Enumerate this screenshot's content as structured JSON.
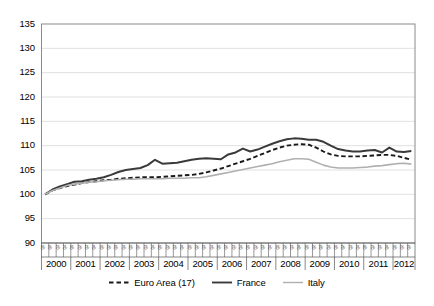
{
  "chart_data": {
    "type": "line",
    "title": "",
    "subtitle": "",
    "xlabel": "",
    "ylabel": "",
    "ylim": [
      90,
      135
    ],
    "ytick_labels": [
      "135",
      "130",
      "125",
      "120",
      "115",
      "110",
      "105",
      "100",
      "95",
      "90"
    ],
    "ytick_values": [
      135,
      130,
      125,
      120,
      115,
      110,
      105,
      100,
      95,
      90
    ],
    "grid": true,
    "grid_axis": "y",
    "legend_position": "bottom",
    "years": [
      "2000",
      "2001",
      "2002",
      "2003",
      "2004",
      "2005",
      "2006",
      "2007",
      "2008",
      "2009",
      "2010",
      "2011",
      "2012"
    ],
    "quarter_labels": [
      "Q1",
      "Q2",
      "Q3",
      "Q4"
    ],
    "x": [
      "2000Q1",
      "2000Q2",
      "2000Q3",
      "2000Q4",
      "2001Q1",
      "2001Q2",
      "2001Q3",
      "2001Q4",
      "2002Q1",
      "2002Q2",
      "2002Q3",
      "2002Q4",
      "2003Q1",
      "2003Q2",
      "2003Q3",
      "2003Q4",
      "2004Q1",
      "2004Q2",
      "2004Q3",
      "2004Q4",
      "2005Q1",
      "2005Q2",
      "2005Q3",
      "2005Q4",
      "2006Q1",
      "2006Q2",
      "2006Q3",
      "2006Q4",
      "2007Q1",
      "2007Q2",
      "2007Q3",
      "2007Q4",
      "2008Q1",
      "2008Q2",
      "2008Q3",
      "2008Q4",
      "2009Q1",
      "2009Q2",
      "2009Q3",
      "2009Q4",
      "2010Q1",
      "2010Q2",
      "2010Q3",
      "2010Q4",
      "2011Q1",
      "2011Q2",
      "2011Q3",
      "2011Q4",
      "2012Q1",
      "2012Q2",
      "2012Q3"
    ],
    "series": [
      {
        "name": "Euro Area (17)",
        "style": "dashed",
        "color": "#1a1a1a",
        "width": 1.9,
        "values": [
          100.0,
          100.8,
          101.3,
          101.7,
          102.0,
          102.3,
          102.5,
          102.7,
          102.9,
          103.0,
          103.2,
          103.3,
          103.4,
          103.5,
          103.5,
          103.5,
          103.6,
          103.7,
          103.8,
          103.9,
          104.0,
          104.2,
          104.5,
          104.9,
          105.3,
          105.8,
          106.3,
          106.8,
          107.3,
          107.9,
          108.5,
          109.1,
          109.6,
          110.0,
          110.2,
          110.3,
          110.2,
          109.6,
          108.8,
          108.2,
          107.9,
          107.8,
          107.8,
          107.8,
          107.9,
          108.0,
          108.1,
          108.1,
          107.9,
          107.5,
          107.1
        ]
      },
      {
        "name": "France",
        "style": "solid",
        "color": "#3a3a3a",
        "width": 2.0,
        "values": [
          100.0,
          101.0,
          101.6,
          102.1,
          102.6,
          102.7,
          103.0,
          103.2,
          103.5,
          104.0,
          104.6,
          105.0,
          105.2,
          105.4,
          106.0,
          107.1,
          106.3,
          106.4,
          106.5,
          106.8,
          107.1,
          107.3,
          107.4,
          107.3,
          107.2,
          108.2,
          108.6,
          109.4,
          108.8,
          109.2,
          109.8,
          110.4,
          110.9,
          111.3,
          111.5,
          111.4,
          111.2,
          111.2,
          110.8,
          110.0,
          109.3,
          109.0,
          108.8,
          108.8,
          109.0,
          109.1,
          108.6,
          109.6,
          108.8,
          108.7,
          108.9
        ]
      },
      {
        "name": "Italy",
        "style": "solid",
        "color": "#b0b0b0",
        "width": 1.6,
        "values": [
          100.0,
          100.8,
          101.3,
          101.8,
          102.1,
          102.3,
          102.5,
          102.6,
          102.8,
          102.9,
          103.0,
          103.1,
          103.1,
          103.2,
          103.2,
          103.2,
          103.2,
          103.3,
          103.3,
          103.3,
          103.4,
          103.4,
          103.6,
          103.9,
          104.2,
          104.5,
          104.8,
          105.1,
          105.4,
          105.7,
          106.0,
          106.3,
          106.7,
          107.0,
          107.3,
          107.3,
          107.2,
          106.6,
          106.0,
          105.6,
          105.4,
          105.4,
          105.4,
          105.5,
          105.6,
          105.8,
          105.9,
          106.1,
          106.3,
          106.4,
          106.2
        ]
      }
    ]
  },
  "legend": {
    "items": [
      {
        "label": "Euro Area (17)",
        "style": "dashed",
        "color": "#1a1a1a"
      },
      {
        "label": "France",
        "style": "solid",
        "color": "#3a3a3a"
      },
      {
        "label": "Italy",
        "style": "solid",
        "color": "#b0b0b0"
      }
    ]
  }
}
